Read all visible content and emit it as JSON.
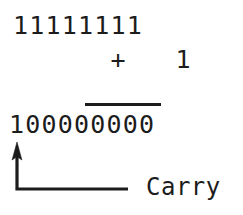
{
  "figure": {
    "type": "binary-addition-carry-diagram",
    "background_color": "#ffffff",
    "ink_color": "#1c1c1c"
  },
  "equation": {
    "augend": "11111111",
    "operator": "+",
    "addend": "1",
    "augend_row_text": "11111111",
    "addend_row_text": "      +   1",
    "sum": "100000000",
    "rule_visible": true
  },
  "annotation": {
    "carry_label": "Carry",
    "pointer": {
      "shape": "elbow-arrow",
      "direction": "up",
      "arrow_tip": [
        17,
        148
      ],
      "corner": [
        17,
        189
      ],
      "line_end": [
        128,
        189
      ]
    }
  }
}
